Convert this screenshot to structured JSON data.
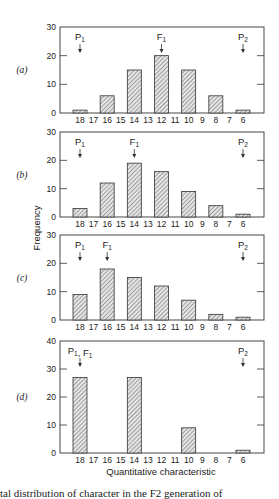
{
  "chart_data": [
    {
      "type": "bar",
      "panel_label": "(a)",
      "categories": [
        "18",
        "17",
        "16",
        "15",
        "14",
        "13",
        "12",
        "11",
        "10",
        "9",
        "8",
        "7",
        "6"
      ],
      "values": [
        1,
        0,
        6,
        0,
        15,
        0,
        20,
        0,
        15,
        0,
        6,
        0,
        1
      ],
      "ylim": [
        0,
        30
      ],
      "yticks": [
        0,
        10,
        20,
        30
      ],
      "markers": [
        {
          "label": "P1",
          "at": "18"
        },
        {
          "label": "F1",
          "at": "12"
        },
        {
          "label": "P2",
          "at": "6"
        }
      ]
    },
    {
      "type": "bar",
      "panel_label": "(b)",
      "categories": [
        "18",
        "17",
        "16",
        "15",
        "14",
        "13",
        "12",
        "11",
        "10",
        "9",
        "8",
        "7",
        "6"
      ],
      "values": [
        3,
        0,
        12,
        0,
        19,
        0,
        16,
        0,
        9,
        0,
        4,
        0,
        1
      ],
      "ylim": [
        0,
        30
      ],
      "yticks": [
        0,
        10,
        20,
        30
      ],
      "markers": [
        {
          "label": "P1",
          "at": "18"
        },
        {
          "label": "F1",
          "at": "14"
        },
        {
          "label": "P2",
          "at": "6"
        }
      ]
    },
    {
      "type": "bar",
      "panel_label": "(c)",
      "categories": [
        "18",
        "17",
        "16",
        "15",
        "14",
        "13",
        "12",
        "11",
        "10",
        "9",
        "8",
        "7",
        "6"
      ],
      "values": [
        9,
        0,
        18,
        0,
        15,
        0,
        12,
        0,
        7,
        0,
        2,
        0,
        1
      ],
      "ylim": [
        0,
        30
      ],
      "yticks": [
        0,
        10,
        20,
        30
      ],
      "markers": [
        {
          "label": "P1",
          "at": "16"
        },
        {
          "label": "F1",
          "at": "16"
        },
        {
          "label": "P2",
          "at": "6"
        }
      ]
    },
    {
      "type": "bar",
      "panel_label": "(d)",
      "categories": [
        "18",
        "17",
        "16",
        "15",
        "14",
        "13",
        "12",
        "11",
        "10",
        "9",
        "8",
        "7",
        "6"
      ],
      "values": [
        27,
        0,
        0,
        0,
        27,
        0,
        0,
        0,
        9,
        0,
        0,
        0,
        1
      ],
      "ylim": [
        0,
        40
      ],
      "yticks": [
        0,
        10,
        20,
        30,
        40
      ],
      "markers": [
        {
          "label": "P1, F1",
          "at": "18"
        },
        {
          "label": "P2",
          "at": "6"
        }
      ]
    }
  ],
  "shared": {
    "ylabel": "Frequency",
    "xlabel": "Quantitative characteristic",
    "grid": false,
    "bar_style": "hatched"
  },
  "caption_fragment": "tal distribution of character in the F2 generation of"
}
